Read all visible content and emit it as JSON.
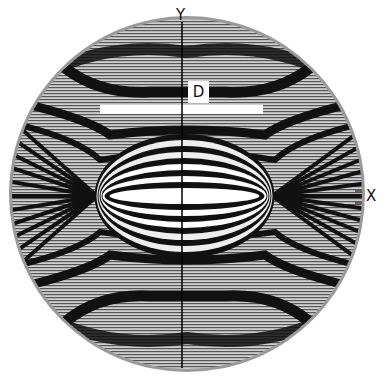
{
  "figure": {
    "type": "interference-fringe-pattern",
    "axes": {
      "x_label": "X",
      "y_label": "Y"
    },
    "annotation_label": "D",
    "colors": {
      "background": "#ffffff",
      "fringe_dark": "#111111",
      "fringe_light": "#e8e8e8",
      "rim": "#9a9a9a"
    }
  }
}
